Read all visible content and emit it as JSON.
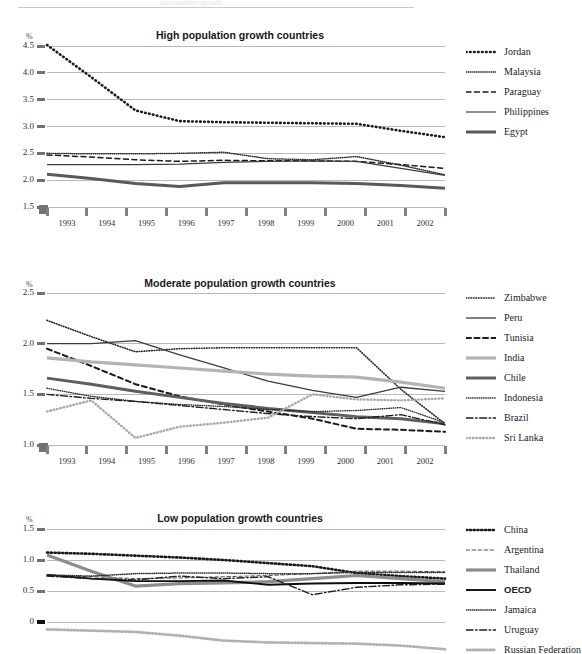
{
  "page": {
    "background": "#ffffff",
    "header_rule_visible": true,
    "header_ghost_text": "population growth"
  },
  "axis_common": {
    "x_categories": [
      "1993",
      "1994",
      "1995",
      "1996",
      "1997",
      "1998",
      "1999",
      "2000",
      "2001",
      "2002"
    ],
    "unit_label": "%",
    "gridline_color": "#b9b9b9",
    "tick_color": "#6f7276"
  },
  "chart_data": [
    {
      "id": "high",
      "type": "line",
      "title": "High population growth countries",
      "xlabel": "",
      "ylabel": "%",
      "ylim": [
        1.5,
        4.5
      ],
      "yticks": [
        1.5,
        2.0,
        2.5,
        3.0,
        3.5,
        4.0,
        4.5
      ],
      "ytick_labels": [
        "1.5",
        "2.0",
        "2.5",
        "3.0",
        "3.5",
        "4.0",
        "4.5"
      ],
      "x": [
        "1993",
        "1994",
        "1995",
        "1996",
        "1997",
        "1998",
        "1999",
        "2000",
        "2001",
        "2002"
      ],
      "grid": true,
      "legend_position": "right",
      "series": [
        {
          "name": "Jordan",
          "style": "dotted-heavy",
          "color": "#1a1a1a",
          "width": 2.6,
          "dash": "0.6 3.4",
          "values": [
            4.52,
            3.92,
            3.3,
            3.1,
            3.08,
            3.07,
            3.06,
            3.05,
            2.92,
            2.8
          ]
        },
        {
          "name": "Malaysia",
          "style": "dotted-fine",
          "color": "#2a2a2a",
          "width": 1.5,
          "dash": "0.5 1.6",
          "values": [
            2.5,
            2.49,
            2.49,
            2.5,
            2.52,
            2.4,
            2.38,
            2.44,
            2.28,
            2.1
          ]
        },
        {
          "name": "Paraguay",
          "style": "dashed",
          "color": "#1a1a1a",
          "width": 1.5,
          "dash": "5 3.5",
          "values": [
            2.47,
            2.43,
            2.38,
            2.35,
            2.37,
            2.36,
            2.36,
            2.35,
            2.29,
            2.22
          ]
        },
        {
          "name": "Philippines",
          "style": "solid-thin",
          "color": "#3a3d40",
          "width": 1.2,
          "dash": "",
          "values": [
            2.29,
            2.29,
            2.29,
            2.3,
            2.33,
            2.35,
            2.36,
            2.35,
            2.22,
            2.09
          ]
        },
        {
          "name": "Egypt",
          "style": "solid-thick",
          "color": "#58595b",
          "width": 3.0,
          "dash": "",
          "values": [
            2.11,
            2.03,
            1.94,
            1.88,
            1.95,
            1.95,
            1.95,
            1.94,
            1.9,
            1.85
          ]
        }
      ]
    },
    {
      "id": "moderate",
      "type": "line",
      "title": "Moderate population growth countries",
      "xlabel": "",
      "ylabel": "%",
      "ylim": [
        1.0,
        2.5
      ],
      "yticks": [
        1.0,
        1.5,
        2.0,
        2.5
      ],
      "ytick_labels": [
        "1.0",
        "1.5",
        "2.0",
        "2.5"
      ],
      "x": [
        "1993",
        "1994",
        "1995",
        "1996",
        "1997",
        "1998",
        "1999",
        "2000",
        "2001",
        "2002"
      ],
      "grid": true,
      "legend_position": "right",
      "series": [
        {
          "name": "Zimbabwe",
          "style": "dotted-fine",
          "color": "#202020",
          "width": 1.6,
          "dash": "0.6 1.9",
          "values": [
            2.23,
            2.07,
            1.92,
            1.95,
            1.96,
            1.96,
            1.96,
            1.96,
            1.55,
            1.21
          ]
        },
        {
          "name": "Peru",
          "style": "solid-thin",
          "color": "#3a3d40",
          "width": 1.3,
          "dash": "",
          "values": [
            2.0,
            2.0,
            2.03,
            1.89,
            1.76,
            1.63,
            1.54,
            1.47,
            1.57,
            1.53
          ]
        },
        {
          "name": "Tunisia",
          "style": "dashed",
          "color": "#1a1a1a",
          "width": 2.0,
          "dash": "5 3.5",
          "values": [
            1.95,
            1.78,
            1.6,
            1.48,
            1.4,
            1.33,
            1.26,
            1.16,
            1.15,
            1.13
          ]
        },
        {
          "name": "India",
          "style": "solid-light",
          "color": "#b3b3b3",
          "width": 3.2,
          "dash": "",
          "values": [
            1.86,
            1.82,
            1.79,
            1.76,
            1.73,
            1.7,
            1.68,
            1.67,
            1.62,
            1.56
          ]
        },
        {
          "name": "Chile",
          "style": "solid-thick",
          "color": "#5c5e60",
          "width": 3.0,
          "dash": "",
          "values": [
            1.66,
            1.6,
            1.53,
            1.47,
            1.41,
            1.36,
            1.32,
            1.28,
            1.26,
            1.21
          ]
        },
        {
          "name": "Indonesia",
          "style": "dotted-fine2",
          "color": "#2a2a2a",
          "width": 1.4,
          "dash": "0.5 1.7",
          "values": [
            1.56,
            1.48,
            1.43,
            1.4,
            1.38,
            1.35,
            1.33,
            1.34,
            1.37,
            1.22
          ]
        },
        {
          "name": "Brazil",
          "style": "dash-dot",
          "color": "#1f1f1f",
          "width": 1.4,
          "dash": "7 2.5 1.6 2.5",
          "values": [
            1.5,
            1.46,
            1.43,
            1.39,
            1.35,
            1.31,
            1.28,
            1.26,
            1.3,
            1.2
          ]
        },
        {
          "name": "Sri Lanka",
          "style": "dotted-light",
          "color": "#a8a8a8",
          "width": 2.4,
          "dash": "0.6 2.8",
          "values": [
            1.33,
            1.44,
            1.07,
            1.18,
            1.22,
            1.27,
            1.5,
            1.45,
            1.44,
            1.46
          ]
        }
      ]
    },
    {
      "id": "low",
      "type": "line",
      "title": "Low population growth countries",
      "xlabel": "",
      "ylabel": "%",
      "ylim": [
        -0.5,
        1.5
      ],
      "yticks": [
        0,
        0.5,
        1.0,
        1.5
      ],
      "ytick_labels": [
        "0",
        "0.5",
        "1.0",
        "1.5"
      ],
      "x": [
        "1993",
        "1994",
        "1995",
        "1996",
        "1997",
        "1998",
        "1999",
        "2000",
        "2001",
        "2002"
      ],
      "grid": true,
      "legend_position": "right",
      "series": [
        {
          "name": "China",
          "style": "dotted-heavy",
          "color": "#1a1a1a",
          "width": 2.6,
          "dash": "1.2 2.6",
          "values": [
            1.12,
            1.1,
            1.07,
            1.04,
            1.0,
            0.95,
            0.9,
            0.79,
            0.74,
            0.7
          ]
        },
        {
          "name": "Argentina",
          "style": "dashed-fine",
          "color": "#3a3a3a",
          "width": 0.9,
          "dash": "3.5 2.5",
          "values": [
            0.75,
            0.73,
            0.7,
            0.71,
            0.73,
            0.75,
            0.78,
            0.82,
            0.82,
            0.81
          ]
        },
        {
          "name": "Thailand",
          "style": "solid-gray",
          "color": "#8a8c8e",
          "width": 3.2,
          "dash": "",
          "values": [
            1.08,
            0.82,
            0.58,
            0.62,
            0.63,
            0.65,
            0.7,
            0.75,
            0.7,
            0.65
          ]
        },
        {
          "name": "OECD",
          "style": "solid-black",
          "color": "#0d0d0d",
          "width": 1.9,
          "dash": "",
          "values": [
            0.76,
            0.7,
            0.66,
            0.66,
            0.67,
            0.6,
            0.62,
            0.63,
            0.63,
            0.62
          ]
        },
        {
          "name": "Jamaica",
          "style": "dotted-fine",
          "color": "#2a2a2a",
          "width": 1.5,
          "dash": "0.5 1.6",
          "values": [
            0.76,
            0.74,
            0.78,
            0.79,
            0.79,
            0.78,
            0.78,
            0.8,
            0.8,
            0.8
          ]
        },
        {
          "name": "Uruguay",
          "style": "dash-dot",
          "color": "#1f1f1f",
          "width": 1.4,
          "dash": "7 2.5 1.6 2.5",
          "values": [
            0.74,
            0.7,
            0.68,
            0.74,
            0.7,
            0.73,
            0.44,
            0.56,
            0.6,
            0.61
          ]
        },
        {
          "name": "Russian Federation",
          "style": "dotted-light",
          "color": "#b0b0b0",
          "width": 2.8,
          "dash": "1.0 2.4",
          "values": [
            -0.12,
            -0.14,
            -0.16,
            -0.22,
            -0.3,
            -0.33,
            -0.34,
            -0.35,
            -0.38,
            -0.44
          ]
        }
      ]
    }
  ]
}
